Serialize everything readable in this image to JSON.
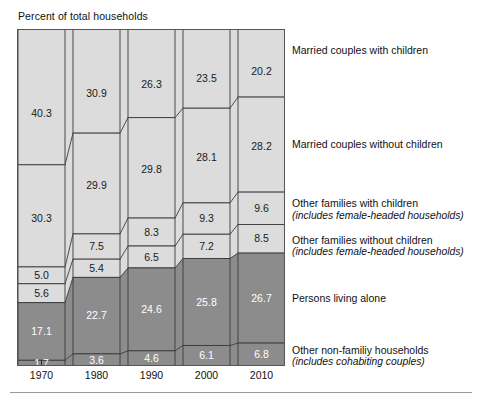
{
  "axis_title": "Percent of total households",
  "years": [
    "1970",
    "1980",
    "1990",
    "2000",
    "2010"
  ],
  "legend": [
    {
      "line1": "Married couples with children",
      "line2": ""
    },
    {
      "line1": "Married couples without children",
      "line2": ""
    },
    {
      "line1": "Other families with children",
      "line2": "(includes female-headed households)"
    },
    {
      "line1": "Other families without children",
      "line2": "(includes female-headed households)"
    },
    {
      "line1": "Persons living alone",
      "line2": ""
    },
    {
      "line1": "Other non-familiy households",
      "line2": "(includes cohabiting couples)"
    }
  ],
  "colors": {
    "light_band": "#dcdcdc",
    "dark_band": "#8c8c8c",
    "ribbon_light": "#dcdcdc",
    "ribbon_dark": "#8c8c8c",
    "outline": "#3a3a3a",
    "gap": "#ffffff",
    "label_light": "#1a1a1a",
    "label_dark": "#ffffff",
    "rule": "#9a9a9a"
  },
  "chart_data": {
    "type": "area",
    "title": "",
    "subtitle": "",
    "xlabel": "",
    "ylabel": "Percent of total households",
    "ylim": [
      0,
      100
    ],
    "grid": false,
    "legend_position": "right",
    "stacked": true,
    "normalized_percent": true,
    "categories": [
      "1970",
      "1980",
      "1990",
      "2000",
      "2010"
    ],
    "series": [
      {
        "name": "Married couples with children",
        "values": [
          40.3,
          30.9,
          26.3,
          23.5,
          20.2
        ],
        "color": "#dcdcdc",
        "label_color": "#1a1a1a"
      },
      {
        "name": "Married couples without children",
        "values": [
          30.3,
          29.9,
          29.8,
          28.1,
          28.2
        ],
        "color": "#dcdcdc",
        "label_color": "#1a1a1a"
      },
      {
        "name": "Other families with children",
        "values": [
          5.0,
          7.5,
          8.3,
          9.3,
          9.6
        ],
        "color": "#dcdcdc",
        "label_color": "#1a1a1a"
      },
      {
        "name": "Other families without children",
        "values": [
          5.6,
          5.4,
          6.5,
          7.2,
          8.5
        ],
        "color": "#dcdcdc",
        "label_color": "#1a1a1a"
      },
      {
        "name": "Persons living alone",
        "values": [
          17.1,
          22.7,
          24.6,
          25.8,
          26.7
        ],
        "color": "#8c8c8c",
        "label_color": "#ffffff"
      },
      {
        "name": "Other non-familiy households",
        "values": [
          1.7,
          3.6,
          4.6,
          6.1,
          6.8
        ],
        "color": "#8c8c8c",
        "label_color": "#ffffff"
      }
    ],
    "data_labels": {
      "1970": [
        40.3,
        30.3,
        5.0,
        5.6,
        17.1,
        1.7
      ],
      "1980": [
        30.9,
        29.9,
        7.5,
        5.4,
        22.7,
        3.6
      ],
      "1990": [
        26.3,
        29.8,
        8.3,
        6.5,
        24.6,
        4.6
      ],
      "2000": [
        23.5,
        28.1,
        9.3,
        7.2,
        25.8,
        6.1
      ],
      "2010": [
        20.2,
        28.2,
        9.6,
        8.5,
        26.7,
        6.8
      ]
    }
  }
}
